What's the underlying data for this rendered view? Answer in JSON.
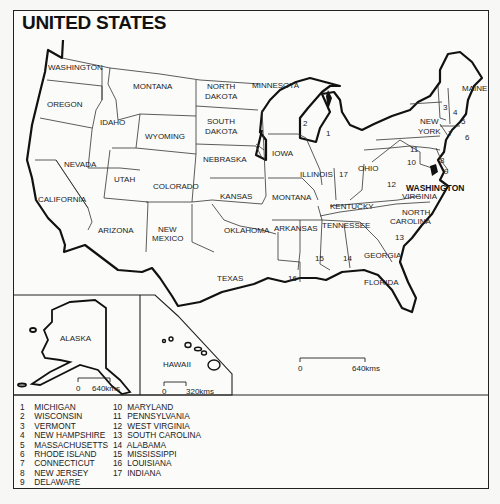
{
  "title": "UNITED STATES",
  "states": {
    "washington": "WASHINGTON",
    "oregon": "OREGON",
    "california": "CALIFORNIA",
    "nevada": "NEVADA",
    "idaho": "IDAHO",
    "montana": "MONTANA",
    "wyoming": "WYOMING",
    "utah": "UTAH",
    "arizona": "ARIZONA",
    "colorado": "COLORADO",
    "new_mexico_1": "NEW",
    "new_mexico_2": "MEXICO",
    "north_dakota_1": "NORTH",
    "north_dakota_2": "DAKOTA",
    "south_dakota_1": "SOUTH",
    "south_dakota_2": "DAKOTA",
    "nebraska": "NEBRASKA",
    "kansas": "KANSAS",
    "oklahoma": "OKLAHOMA",
    "texas": "TEXAS",
    "minnesota": "MINNESOTA",
    "iowa": "IOWA",
    "missouri_as_labeled": "MONTANA",
    "arkansas": "ARKANSAS",
    "illinois": "ILLINOIS",
    "ohio": "OHIO",
    "kentucky": "KENTUCKY",
    "tennessee": "TENNESSEE",
    "virginia": "VIRGINIA",
    "north_carolina_1": "NORTH",
    "north_carolina_2": "CAROLINA",
    "georgia": "GEORGIA",
    "florida": "FLORIDA",
    "new_york_1": "NEW",
    "new_york_2": "YORK",
    "maine": "MAINE",
    "washington_dc": "WASHINGTON",
    "alaska": "ALASKA",
    "hawaii": "HAWAII"
  },
  "numbers": {
    "n1": "1",
    "n2": "2",
    "n3": "3",
    "n4": "4",
    "n5": "5",
    "n6": "6",
    "n7": "7",
    "n8": "8",
    "n9": "9",
    "n10": "10",
    "n11": "11",
    "n12": "12",
    "n13": "13",
    "n14": "14",
    "n15": "15",
    "n16": "16",
    "n17": "17"
  },
  "scales": {
    "main": {
      "start": "0",
      "end": "640kms"
    },
    "alaska": {
      "start": "0",
      "end": "640kms"
    },
    "hawaii": {
      "start": "0",
      "end": "320kms"
    }
  },
  "legend": {
    "col1": [
      {
        "n": "1",
        "name": "MICHIGAN"
      },
      {
        "n": "2",
        "name": "WISCONSIN"
      },
      {
        "n": "3",
        "name": "VERMONT"
      },
      {
        "n": "4",
        "name": "NEW HAMPSHIRE"
      },
      {
        "n": "5",
        "name": "MASSACHUSETTS"
      },
      {
        "n": "6",
        "name": "RHODE ISLAND"
      },
      {
        "n": "7",
        "name": "CONNECTICUT"
      },
      {
        "n": "8",
        "name": "NEW JERSEY"
      },
      {
        "n": "9",
        "name": "DELAWARE"
      }
    ],
    "col2": [
      {
        "n": "10",
        "name": "MARYLAND"
      },
      {
        "n": "11",
        "name": "PENNSYLVANIA"
      },
      {
        "n": "12",
        "name": "WEST VIRGINIA"
      },
      {
        "n": "13",
        "name": "SOUTH CAROLINA"
      },
      {
        "n": "14",
        "name": "ALABAMA"
      },
      {
        "n": "15",
        "name": "MISSISSIPPI"
      },
      {
        "n": "16",
        "name": "LOUISIANA"
      },
      {
        "n": "17",
        "name": "INDIANA"
      }
    ]
  },
  "colors": {
    "ink": "#111111",
    "paper": "#fbfbf9"
  }
}
